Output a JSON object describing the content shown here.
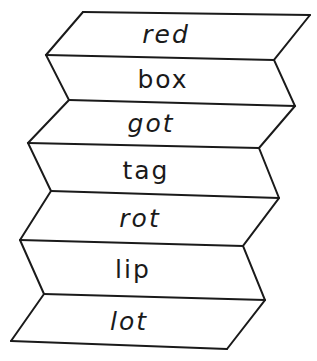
{
  "diagram": {
    "type": "folded-paper-word-ladder",
    "line_color": "#1a1a1a",
    "background": "#ffffff",
    "panels": [
      {
        "word": "red",
        "style": "slanted"
      },
      {
        "word": "box",
        "style": "upright"
      },
      {
        "word": "got",
        "style": "slanted"
      },
      {
        "word": "tag",
        "style": "upright"
      },
      {
        "word": "rot",
        "style": "slanted"
      },
      {
        "word": "lip",
        "style": "upright"
      },
      {
        "word": "lot",
        "style": "slanted"
      }
    ]
  }
}
